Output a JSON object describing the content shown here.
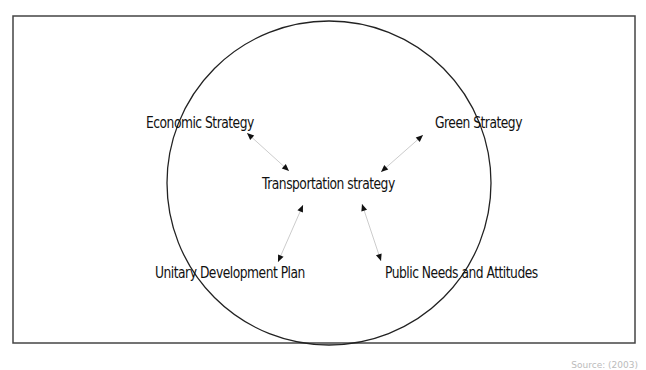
{
  "diagram": {
    "frame": {
      "x": 13,
      "y": 16,
      "width": 622,
      "height": 327,
      "stroke": "#444444"
    },
    "circle": {
      "cx": 329,
      "cy": 183,
      "r": 162,
      "stroke": "#222222"
    },
    "center_node": {
      "label": "Transportation strategy",
      "x": 262,
      "y": 175
    },
    "nodes": [
      {
        "id": "economic",
        "label": "Economic Strategy",
        "x": 146,
        "y": 114
      },
      {
        "id": "green",
        "label": "Green Strategy",
        "x": 435,
        "y": 114
      },
      {
        "id": "unitary",
        "label": "Unitary Development Plan",
        "x": 155,
        "y": 264
      },
      {
        "id": "public",
        "label": "Public Needs and Attitudes",
        "x": 385,
        "y": 264
      }
    ],
    "arrows": [
      {
        "from": "economic",
        "x1": 247,
        "y1": 133,
        "x2": 289,
        "y2": 171
      },
      {
        "from": "green",
        "x1": 423,
        "y1": 135,
        "x2": 381,
        "y2": 172
      },
      {
        "from": "unitary",
        "x1": 303,
        "y1": 205,
        "x2": 278,
        "y2": 262
      },
      {
        "from": "public",
        "x1": 362,
        "y1": 204,
        "x2": 381,
        "y2": 261
      }
    ],
    "arrow_color": "#cccccc",
    "arrowhead_color": "#111111",
    "source_note": "Source: (2003)"
  }
}
